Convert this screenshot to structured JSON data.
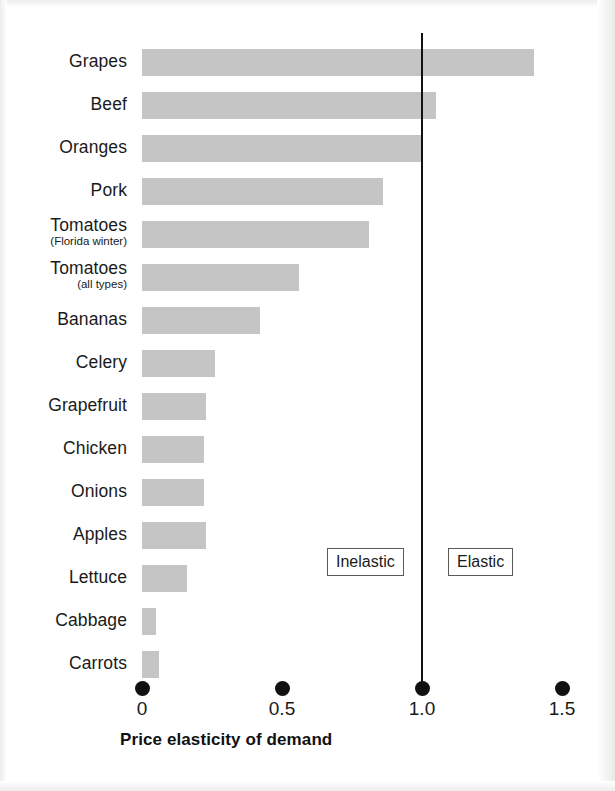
{
  "chart_data": {
    "type": "bar",
    "orientation": "horizontal",
    "title": "",
    "xlabel": "Price elasticity of demand",
    "ylabel": "",
    "xlim": [
      0,
      1.5
    ],
    "ticks": [
      "0",
      "0.5",
      "1.0",
      "1.5"
    ],
    "tick_values": [
      0,
      0.5,
      1.0,
      1.5
    ],
    "grid": false,
    "legend": "none",
    "bar_color": "#c5c5c5",
    "reference_line": {
      "value": 1.0,
      "color": "#111111",
      "label_left": "Inelastic",
      "label_right": "Elastic"
    },
    "categories": [
      "Grapes",
      "Beef",
      "Oranges",
      "Pork",
      "Tomatoes",
      "Tomatoes",
      "Bananas",
      "Celery",
      "Grapefruit",
      "Chicken",
      "Onions",
      "Apples",
      "Lettuce",
      "Cabbage",
      "Carrots"
    ],
    "values": [
      1.4,
      1.05,
      1.0,
      0.86,
      0.81,
      0.56,
      0.42,
      0.26,
      0.23,
      0.22,
      0.22,
      0.23,
      0.16,
      0.05,
      0.06
    ],
    "bars": [
      {
        "label": "Grapes",
        "sublabel": "",
        "value": 1.4
      },
      {
        "label": "Beef",
        "sublabel": "",
        "value": 1.05
      },
      {
        "label": "Oranges",
        "sublabel": "",
        "value": 1.0
      },
      {
        "label": "Pork",
        "sublabel": "",
        "value": 0.86
      },
      {
        "label": "Tomatoes",
        "sublabel": "(Florida winter)",
        "value": 0.81
      },
      {
        "label": "Tomatoes",
        "sublabel": "(all types)",
        "value": 0.56
      },
      {
        "label": "Bananas",
        "sublabel": "",
        "value": 0.42
      },
      {
        "label": "Celery",
        "sublabel": "",
        "value": 0.26
      },
      {
        "label": "Grapefruit",
        "sublabel": "",
        "value": 0.23
      },
      {
        "label": "Chicken",
        "sublabel": "",
        "value": 0.22
      },
      {
        "label": "Onions",
        "sublabel": "",
        "value": 0.22
      },
      {
        "label": "Apples",
        "sublabel": "",
        "value": 0.23
      },
      {
        "label": "Lettuce",
        "sublabel": "",
        "value": 0.16
      },
      {
        "label": "Cabbage",
        "sublabel": "",
        "value": 0.05
      },
      {
        "label": "Carrots",
        "sublabel": "",
        "value": 0.06
      }
    ]
  },
  "axis": {
    "title": "Price elasticity of demand",
    "ticks": [
      {
        "label": "0",
        "value": 0
      },
      {
        "label": "0.5",
        "value": 0.5
      },
      {
        "label": "1.0",
        "value": 1.0
      },
      {
        "label": "1.5",
        "value": 1.5
      }
    ]
  },
  "annotations": {
    "inelastic": "Inelastic",
    "elastic": "Elastic"
  },
  "geometry": {
    "plot_left": 142,
    "unit_px": 280,
    "row_top": 40,
    "row_pitch": 43,
    "bar_height": 27,
    "axis_top": 672
  }
}
